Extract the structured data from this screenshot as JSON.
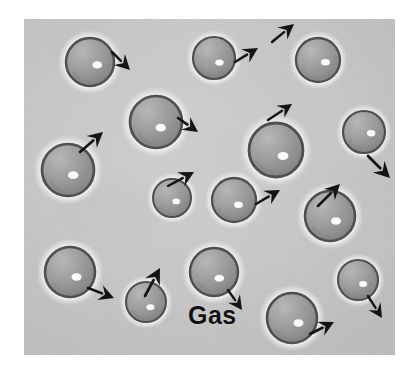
{
  "figure": {
    "kind": "photograph-illustration",
    "caption_label": "Gas",
    "alt_description": "Grey spheres spaced far apart moving in random directions, illustrating the gas state of matter",
    "frame": {
      "x": 24,
      "y": 19,
      "width": 371,
      "height": 336
    },
    "colors": {
      "page_background": "#ffffff",
      "photo_background": "#c9c9c9",
      "photo_background_light": "#dcdcdc",
      "photo_background_dark": "#b4b4b4",
      "sphere_fill": "#9b9b9b",
      "sphere_fill_light": "#b7b7b7",
      "sphere_fill_dark": "#818181",
      "sphere_outline": "#4f4f4f",
      "sphere_halo": "#f2f2f2",
      "highlight": "#fbfbfb",
      "arrow": "#141414",
      "label_text": "#111111"
    },
    "label": {
      "text": "Gas",
      "x": 188,
      "y": 303,
      "font_size": 25
    },
    "particles": [
      {
        "id": "particle-1",
        "cx": 90,
        "cy": 62,
        "r": 24,
        "hx": 0.3,
        "hy": 0.12
      },
      {
        "id": "particle-2",
        "cx": 214,
        "cy": 58,
        "r": 21,
        "hx": 0.26,
        "hy": 0.22
      },
      {
        "id": "particle-3",
        "cx": 318,
        "cy": 60,
        "r": 22,
        "hx": 0.34,
        "hy": 0.1
      },
      {
        "id": "particle-4",
        "cx": 156,
        "cy": 122,
        "r": 26,
        "hx": 0.18,
        "hy": 0.22
      },
      {
        "id": "particle-5",
        "cx": 276,
        "cy": 150,
        "r": 27,
        "hx": 0.26,
        "hy": 0.22
      },
      {
        "id": "particle-6",
        "cx": 364,
        "cy": 132,
        "r": 21,
        "hx": 0.34,
        "hy": 0.06
      },
      {
        "id": "particle-7",
        "cx": 68,
        "cy": 170,
        "r": 26,
        "hx": 0.2,
        "hy": 0.2
      },
      {
        "id": "particle-8",
        "cx": 172,
        "cy": 198,
        "r": 19,
        "hx": 0.22,
        "hy": 0.18
      },
      {
        "id": "particle-9",
        "cx": 234,
        "cy": 200,
        "r": 22,
        "hx": 0.2,
        "hy": 0.22
      },
      {
        "id": "particle-10",
        "cx": 330,
        "cy": 216,
        "r": 25,
        "hx": 0.24,
        "hy": 0.2
      },
      {
        "id": "particle-11",
        "cx": 70,
        "cy": 272,
        "r": 25,
        "hx": 0.26,
        "hy": 0.2
      },
      {
        "id": "particle-12",
        "cx": 146,
        "cy": 302,
        "r": 20,
        "hx": 0.22,
        "hy": 0.26
      },
      {
        "id": "particle-13",
        "cx": 214,
        "cy": 272,
        "r": 24,
        "hx": 0.22,
        "hy": 0.26
      },
      {
        "id": "particle-14",
        "cx": 292,
        "cy": 318,
        "r": 25,
        "hx": 0.26,
        "hy": 0.2
      },
      {
        "id": "particle-15",
        "cx": 358,
        "cy": 280,
        "r": 20,
        "hx": 0.26,
        "hy": 0.2
      }
    ],
    "motion_arrows": [
      {
        "id": "arrow-1",
        "x1": 112,
        "y1": 52,
        "x2": 130,
        "y2": 70,
        "size": 15
      },
      {
        "id": "arrow-2",
        "x1": 235,
        "y1": 62,
        "x2": 258,
        "y2": 48,
        "size": 15
      },
      {
        "id": "arrow-3",
        "x1": 272,
        "y1": 42,
        "x2": 294,
        "y2": 24,
        "size": 15
      },
      {
        "id": "arrow-4",
        "x1": 178,
        "y1": 118,
        "x2": 198,
        "y2": 132,
        "size": 15
      },
      {
        "id": "arrow-5",
        "x1": 268,
        "y1": 120,
        "x2": 292,
        "y2": 104,
        "size": 14
      },
      {
        "id": "arrow-6",
        "x1": 80,
        "y1": 152,
        "x2": 103,
        "y2": 132,
        "size": 15
      },
      {
        "id": "arrow-7",
        "x1": 368,
        "y1": 156,
        "x2": 390,
        "y2": 178,
        "size": 16
      },
      {
        "id": "arrow-8",
        "x1": 168,
        "y1": 186,
        "x2": 194,
        "y2": 172,
        "size": 15
      },
      {
        "id": "arrow-9",
        "x1": 256,
        "y1": 204,
        "x2": 280,
        "y2": 190,
        "size": 15
      },
      {
        "id": "arrow-10",
        "x1": 318,
        "y1": 206,
        "x2": 340,
        "y2": 184,
        "size": 15
      },
      {
        "id": "arrow-11",
        "x1": 88,
        "y1": 288,
        "x2": 114,
        "y2": 298,
        "size": 15
      },
      {
        "id": "arrow-12",
        "x1": 145,
        "y1": 296,
        "x2": 160,
        "y2": 268,
        "size": 16
      },
      {
        "id": "arrow-13",
        "x1": 228,
        "y1": 290,
        "x2": 242,
        "y2": 310,
        "size": 14
      },
      {
        "id": "arrow-14",
        "x1": 310,
        "y1": 334,
        "x2": 334,
        "y2": 322,
        "size": 15
      },
      {
        "id": "arrow-15",
        "x1": 368,
        "y1": 296,
        "x2": 382,
        "y2": 318,
        "size": 14
      }
    ],
    "texture_blotches": [
      {
        "cx": 62,
        "cy": 44,
        "rx": 38,
        "ry": 26,
        "o": 0.16,
        "tone": "dark"
      },
      {
        "cx": 196,
        "cy": 36,
        "rx": 52,
        "ry": 22,
        "o": 0.12,
        "tone": "light"
      },
      {
        "cx": 340,
        "cy": 96,
        "rx": 46,
        "ry": 30,
        "o": 0.1,
        "tone": "light"
      },
      {
        "cx": 110,
        "cy": 212,
        "rx": 56,
        "ry": 30,
        "o": 0.14,
        "tone": "dark"
      },
      {
        "cx": 250,
        "cy": 238,
        "rx": 44,
        "ry": 26,
        "o": 0.1,
        "tone": "light"
      },
      {
        "cx": 116,
        "cy": 330,
        "rx": 62,
        "ry": 24,
        "o": 0.12,
        "tone": "dark"
      },
      {
        "cx": 300,
        "cy": 62,
        "rx": 34,
        "ry": 22,
        "o": 0.1,
        "tone": "dark"
      },
      {
        "cx": 56,
        "cy": 120,
        "rx": 30,
        "ry": 24,
        "o": 0.1,
        "tone": "light"
      },
      {
        "cx": 206,
        "cy": 150,
        "rx": 40,
        "ry": 24,
        "o": 0.09,
        "tone": "dark"
      },
      {
        "cx": 370,
        "cy": 238,
        "rx": 30,
        "ry": 30,
        "o": 0.1,
        "tone": "light"
      },
      {
        "cx": 160,
        "cy": 246,
        "rx": 34,
        "ry": 20,
        "o": 0.09,
        "tone": "light"
      },
      {
        "cx": 262,
        "cy": 330,
        "rx": 40,
        "ry": 20,
        "o": 0.09,
        "tone": "dark"
      }
    ]
  }
}
